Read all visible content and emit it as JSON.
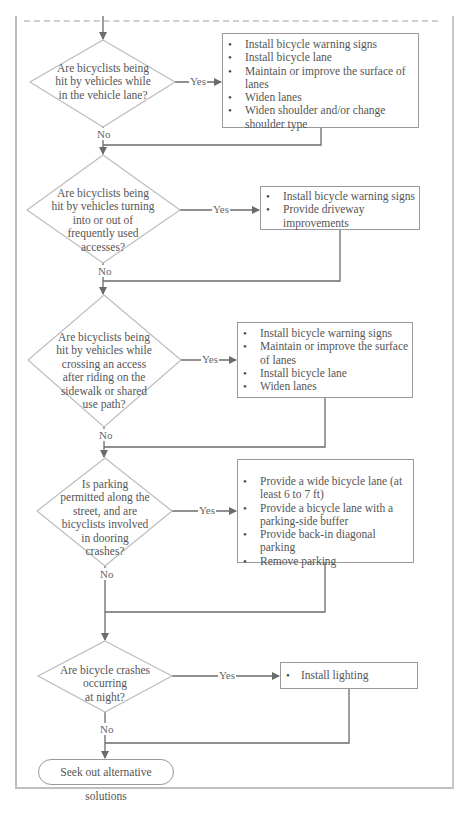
{
  "flowchart": {
    "decisions": [
      {
        "id": "d1",
        "question": [
          "Are bicyclists being",
          "hit by vehicles while",
          "in the vehicle lane?"
        ],
        "yes_label": "Yes",
        "no_label": "No",
        "actions": [
          "Install bicycle warning signs",
          "Install bicycle lane",
          "Maintain or improve the surface of lanes",
          "Widen lanes",
          "Widen shoulder and/or change shoulder type"
        ]
      },
      {
        "id": "d2",
        "question": [
          "Are bicyclists being",
          "hit by vehicles turning",
          "into or out of",
          "frequently used",
          "accesses?"
        ],
        "yes_label": "Yes",
        "no_label": "No",
        "actions": [
          "Install bicycle warning signs",
          "Provide driveway improvements"
        ]
      },
      {
        "id": "d3",
        "question": [
          "Are bicyclists being",
          "hit by vehicles while",
          "crossing an access",
          "after riding on the",
          "sidewalk or shared",
          "use path?"
        ],
        "yes_label": "Yes",
        "no_label": "No",
        "actions": [
          "Install bicycle warning signs",
          "Maintain or improve the surface of lanes",
          "Install bicycle lane",
          "Widen lanes"
        ]
      },
      {
        "id": "d4",
        "question": [
          "Is parking",
          "permitted along the",
          "street, and are",
          "bicyclists involved",
          "in dooring",
          "crashes?"
        ],
        "yes_label": "Yes",
        "no_label": "No",
        "actions": [
          "Provide a wide bicycle lane (at least 6 to 7 ft)",
          "Provide a bicycle lane with a parking-side buffer",
          "Provide back-in diagonal parking",
          "Remove parking"
        ]
      },
      {
        "id": "d5",
        "question": [
          "Are bicycle crashes",
          "occurring",
          "at night?"
        ],
        "yes_label": "Yes",
        "no_label": "No",
        "actions": [
          "Install lighting"
        ]
      }
    ],
    "terminal": "Seek out alternative solutions",
    "colors": {
      "line": "#6b6b6b",
      "diamond_stroke": "#bdbdbd",
      "box_border": "#9a9a9a",
      "text": "#555555"
    }
  }
}
